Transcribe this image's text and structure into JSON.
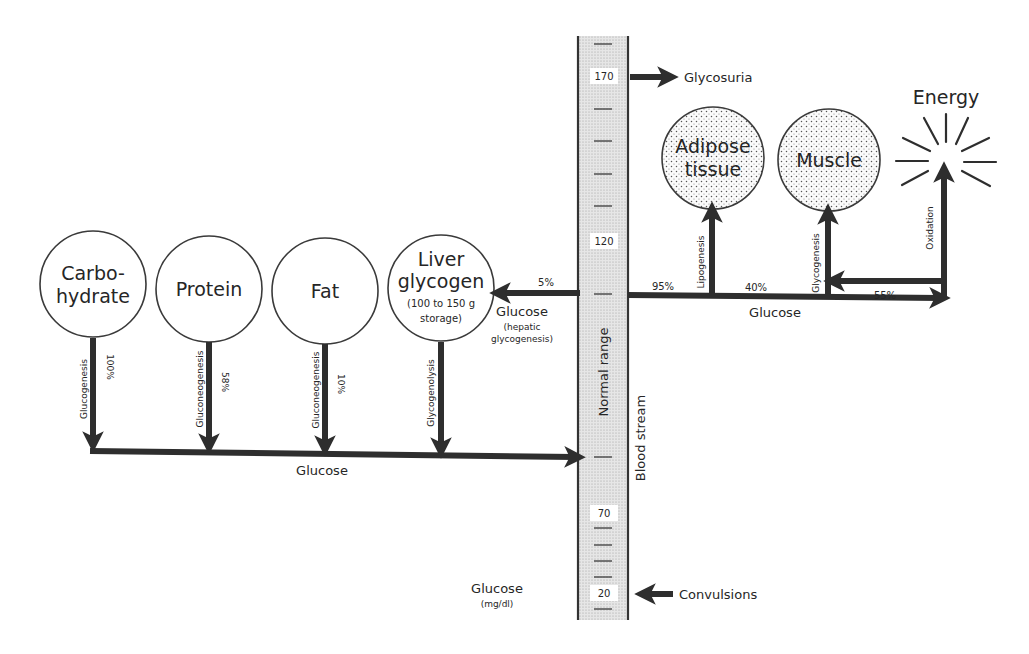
{
  "diagram": {
    "type": "glucose-metabolism-flow",
    "sources": [
      {
        "id": "carbohydrate",
        "label_lines": [
          "Carbo-",
          "hydrate"
        ],
        "process": "Glucogenesis",
        "percent": "100%"
      },
      {
        "id": "protein",
        "label_lines": [
          "Protein"
        ],
        "process": "Gluconeogenesis",
        "percent": "58%"
      },
      {
        "id": "fat",
        "label_lines": [
          "Fat"
        ],
        "process": "Gluconeogenesis",
        "percent": "10%"
      },
      {
        "id": "liver-glycogen",
        "label_lines": [
          "Liver",
          "glycogen",
          "(100 to 150 g",
          "storage)"
        ],
        "process": "Glycogenolysis",
        "percent": ""
      }
    ],
    "source_flow_label": "Glucose",
    "hepatic_flow": {
      "percent": "5%",
      "label": "Glucose",
      "sublabel_lines": [
        "(hepatic",
        "glycogenesis)"
      ]
    },
    "blood_stream": {
      "label": "Blood stream",
      "range_label": "Normal range",
      "axis_title": "Glucose",
      "axis_units": "(mg/dl)",
      "ticks": [
        "170",
        "120",
        "70",
        "20"
      ],
      "high_arrow_label": "Glycosuria",
      "low_arrow_label": "Convulsions"
    },
    "sinks": [
      {
        "id": "adipose",
        "label_lines": [
          "Adipose",
          "tissue"
        ],
        "process": "Lipogenesis",
        "percent": "95%"
      },
      {
        "id": "muscle",
        "label_lines": [
          "Muscle"
        ],
        "process": "Glycogenesis",
        "percent": "40%"
      },
      {
        "id": "energy",
        "label": "Energy",
        "process": "Oxidation",
        "percent": "55%"
      }
    ],
    "sink_flow_label": "Glucose"
  }
}
